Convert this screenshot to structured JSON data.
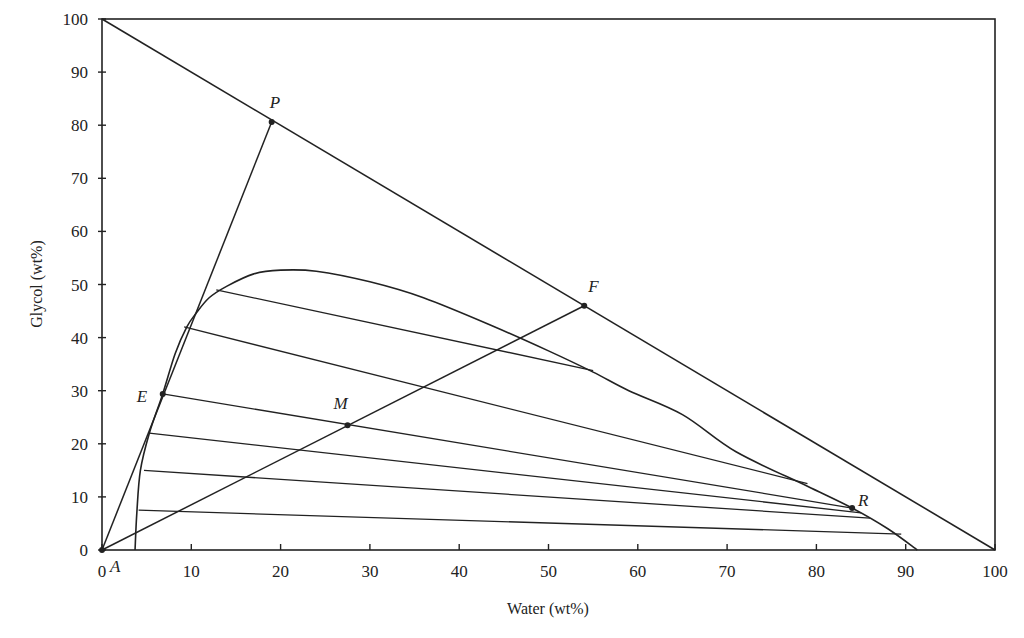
{
  "chart_data": {
    "type": "line",
    "title": "",
    "xlabel": "Water (wt%)",
    "ylabel": "Glycol (wt%)",
    "xlim": [
      0,
      100
    ],
    "ylim": [
      0,
      100
    ],
    "grid": false,
    "x_ticks": [
      0,
      10,
      20,
      30,
      40,
      50,
      60,
      70,
      80,
      90,
      100
    ],
    "y_ticks": [
      0,
      10,
      20,
      30,
      40,
      50,
      60,
      70,
      80,
      90,
      100
    ],
    "hypotenuse": [
      [
        0,
        100
      ],
      [
        100,
        0
      ]
    ],
    "binodal_curve": [
      [
        3.7,
        0
      ],
      [
        3.9,
        7
      ],
      [
        4.3,
        15
      ],
      [
        5.3,
        22
      ],
      [
        6.8,
        29.4
      ],
      [
        8.2,
        37
      ],
      [
        9.5,
        42
      ],
      [
        10.5,
        44.5
      ],
      [
        12,
        47.5
      ],
      [
        14,
        49.7
      ],
      [
        17,
        52
      ],
      [
        20,
        52.7
      ],
      [
        24,
        52.5
      ],
      [
        30,
        50.5
      ],
      [
        36,
        47.5
      ],
      [
        44,
        42
      ],
      [
        50,
        37.5
      ],
      [
        55,
        33.5
      ],
      [
        59,
        30
      ],
      [
        65,
        25.5
      ],
      [
        71,
        18.5
      ],
      [
        79,
        12
      ],
      [
        84,
        7.9
      ],
      [
        88,
        4
      ],
      [
        91.3,
        0
      ]
    ],
    "tie_lines": [
      [
        [
          12.8,
          49
        ],
        [
          55,
          33.8
        ]
      ],
      [
        [
          9.2,
          42
        ],
        [
          79,
          12.5
        ]
      ],
      [
        [
          6.8,
          29.4
        ],
        [
          84,
          7.9
        ]
      ],
      [
        [
          5.3,
          22
        ],
        [
          85,
          7
        ]
      ],
      [
        [
          4.7,
          15
        ],
        [
          86,
          6
        ]
      ],
      [
        [
          4.1,
          7.5
        ],
        [
          89.5,
          3
        ]
      ]
    ],
    "construction_lines": [
      {
        "from": "A",
        "to": "P"
      },
      {
        "from": "A",
        "to": "F"
      }
    ],
    "points": [
      {
        "label": "P",
        "x": 19,
        "y": 80.6
      },
      {
        "label": "F",
        "x": 54,
        "y": 46
      },
      {
        "label": "E",
        "x": 6.8,
        "y": 29.4
      },
      {
        "label": "M",
        "x": 27.5,
        "y": 23.5
      },
      {
        "label": "R",
        "x": 84,
        "y": 7.9
      },
      {
        "label": "A",
        "x": 0,
        "y": 0
      }
    ],
    "colors": {
      "line": "#222222",
      "background": "#ffffff"
    }
  }
}
